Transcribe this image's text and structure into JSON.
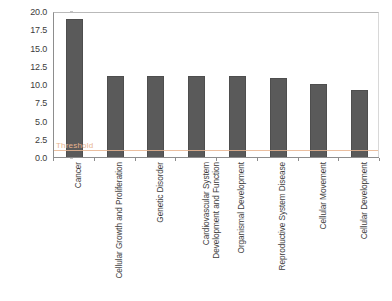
{
  "chart_data": {
    "type": "bar",
    "title": "",
    "subtitle": "",
    "xlabel": "",
    "ylabel": "-log(p-value)",
    "ylim": [
      0.0,
      20.0
    ],
    "ytick_step": 2.5,
    "grid": false,
    "legend": null,
    "bar_color": "#5a5a5a",
    "categories": [
      "Cancer",
      "Cellular Growth and Proliferation",
      "Genetic Disorder",
      "Cardiovascular System Development and Function",
      "Organismal Development",
      "Reproductive System Disease",
      "Cellular Movement",
      "Cellular Development"
    ],
    "category_lines": [
      [
        "Cancer"
      ],
      [
        "Cellular Growth and Proliferation"
      ],
      [
        "Genetic Disorder"
      ],
      [
        "Cardiovascular System",
        "Development and Function"
      ],
      [
        "Organismal Development"
      ],
      [
        "Reproductive System Disease"
      ],
      [
        "Cellular Movement"
      ],
      [
        "Cellular Development"
      ]
    ],
    "values": [
      19.1,
      11.2,
      11.2,
      11.2,
      11.2,
      10.9,
      10.2,
      9.3
    ],
    "ytick_labels": [
      "20.0",
      "17.5",
      "15.0",
      "12.5",
      "10.0",
      "7.5",
      "5.0",
      "2.5",
      "0.0"
    ],
    "ytick_values": [
      20.0,
      17.5,
      15.0,
      12.5,
      10.0,
      7.5,
      5.0,
      2.5,
      0.0
    ],
    "annotations": [
      {
        "name": "threshold",
        "label": "Threshold",
        "value": 1.3,
        "color": "#e8b48f"
      }
    ]
  }
}
